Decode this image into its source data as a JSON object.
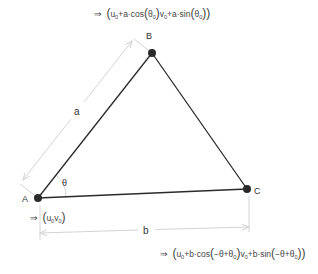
{
  "diagram": {
    "vertices": [
      {
        "id": "A",
        "label": "A",
        "x": 38,
        "y": 198
      },
      {
        "id": "B",
        "label": "B",
        "x": 152,
        "y": 53
      },
      {
        "id": "C",
        "label": "C",
        "x": 247,
        "y": 189
      }
    ],
    "edges": [
      {
        "from": "A",
        "to": "B"
      },
      {
        "from": "B",
        "to": "C"
      },
      {
        "from": "A",
        "to": "C"
      }
    ],
    "dimensions": [
      {
        "label": "a",
        "between": [
          "A",
          "B"
        ]
      },
      {
        "label": "b",
        "between": [
          "A",
          "C"
        ]
      }
    ],
    "angle_label": "θ",
    "formulas": {
      "B": "⇒ (u₀+a·cos(θ₀), v₀+a·sin(θ₀))",
      "A": "⇒ (u₀, v₀)",
      "C": "⇒ (u₀+b·cos(−θ+θ₀), v₀+b·sin(−θ+θ₀))"
    },
    "formula_parts": {
      "arrow": "⇒",
      "B": {
        "u": "u",
        "u_sub": "0",
        "u_rest": "+a·cos",
        "th": "θ",
        "th_sub": "0",
        "v": "v",
        "v_sub": "0",
        "v_rest": "+a·sin"
      },
      "A": {
        "u": "u",
        "u_sub": "0",
        "v": "v",
        "v_sub": "0"
      },
      "C": {
        "u": "u",
        "u_sub": "0",
        "u_rest": "+b·cos",
        "arg": "−θ+θ",
        "arg_sub": "0",
        "v": "v",
        "v_sub": "0",
        "v_rest": "+b·sin"
      }
    },
    "colors": {
      "edge": "#2a2a2a",
      "vertex": "#2a2a2a",
      "dimension": "#d4d4d4",
      "text": "#333333"
    }
  }
}
